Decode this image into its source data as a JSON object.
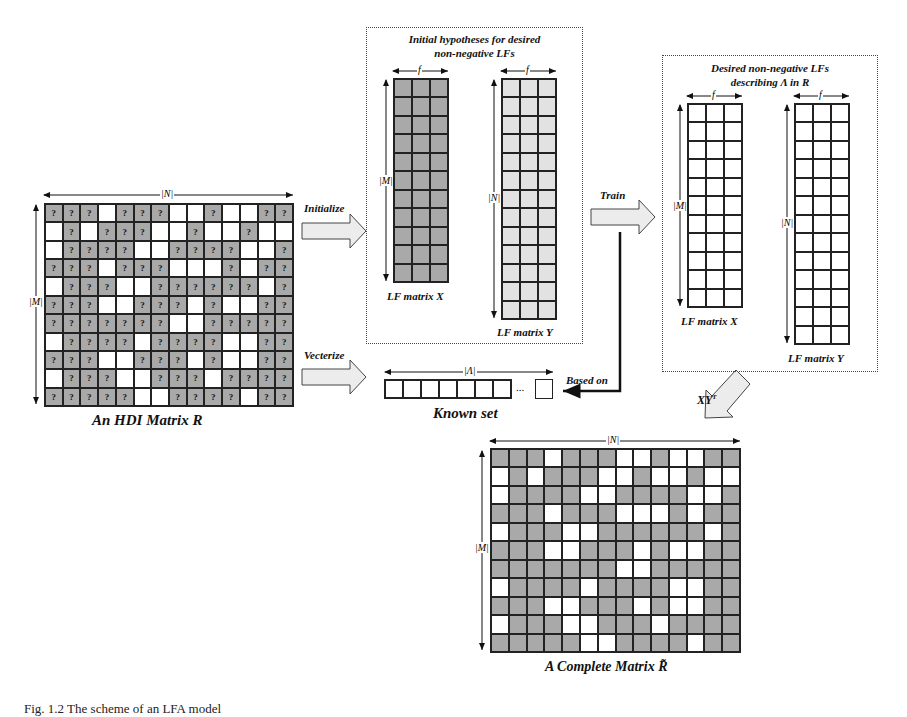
{
  "figure": {
    "caption": "Fig. 1.2  The scheme of an LFA model",
    "colors": {
      "known_cell": "#a9a9a9",
      "unknown_cell": "#ffffff",
      "lf_init_x": "#a9a9a9",
      "lf_init_y": "#e2e2e2",
      "lf_desired": "#f2f2f2"
    }
  },
  "hdi_matrix": {
    "title": "An HDI Matrix R",
    "width_label": "|N|",
    "height_label": "|M|",
    "known_symbol": "?",
    "rows": [
      "GGGWGGGWWGWWGG",
      "WGWGGGWWGWWGWW",
      "WGGGGWWGGGGWWG",
      "GGGWGGGWWWGWGG",
      "WGGGWWGGGGGGWG",
      "GGGWWGGGWGWWGG",
      "GGGGGGGWWGGGGG",
      "WGGGGWGGGGWWGG",
      "GGGWWGGGWGWWGG",
      "WGGGWWGGGWGGGG",
      "GGGGGWWGGGGWGG"
    ]
  },
  "arrows": {
    "initialize": "Initialize",
    "vectorize": "Vecterize",
    "train": "Train",
    "based_on": "Based on",
    "product": "XY",
    "product_sup": "T"
  },
  "initial_box": {
    "title_line1": "Initial hypotheses for desired",
    "title_line2": "non-negative LFs",
    "x_label": "LF matrix X",
    "y_label": "LF matrix Y",
    "f_label": "f",
    "m_label": "|M|",
    "n_label": "|N|",
    "x_rows": 11,
    "y_rows": 13,
    "cols": 3
  },
  "desired_box": {
    "title_line1": "Desired non-negative LFs",
    "title_line2": "describing Λ in R",
    "x_label": "LF matrix X",
    "y_label": "LF matrix Y",
    "f_label": "f",
    "m_label": "|M|",
    "n_label": "|N|",
    "x_rows": 11,
    "y_rows": 13,
    "cols": 3
  },
  "known_set": {
    "title": "Known set",
    "length_label": "|Λ|",
    "ellipsis": "...",
    "cells": 7
  },
  "complete_matrix": {
    "title": "A Complete Matrix R̃",
    "width_label": "|N|",
    "height_label": "|M|"
  }
}
